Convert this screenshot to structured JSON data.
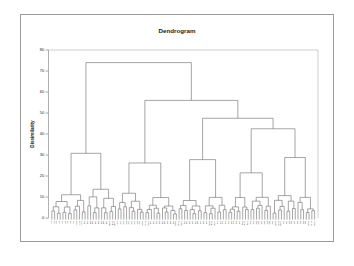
{
  "figure": {
    "title": "Dendrogram",
    "background_color": "#ffffff",
    "frame_color": "#9a9a9a",
    "line_color": "#6e6e6e"
  },
  "chart_data": {
    "type": "dendrogram",
    "title": "Dendrogram",
    "xlabel": "",
    "ylabel": "Dissimilarity",
    "ylim": [
      0,
      80
    ],
    "yticks": [
      0,
      10,
      20,
      30,
      40,
      50,
      60,
      70,
      80
    ],
    "ytick_labels": [
      "0",
      "10",
      "20",
      "30",
      "40",
      "50",
      "60",
      "70",
      "80"
    ],
    "grid": false,
    "legend": "none",
    "orientation": "top-down",
    "n_leaves": 96,
    "leaf_labels": [
      "A1",
      "A2",
      "A3",
      "A4",
      "A5",
      "A6",
      "A7",
      "A8",
      "A9",
      "A10",
      "A11",
      "A12",
      "B1",
      "B2",
      "B3",
      "B4",
      "B5",
      "B6",
      "B7",
      "B8",
      "B9",
      "B10",
      "B11",
      "B12",
      "C1",
      "C2",
      "C3",
      "C4",
      "C5",
      "C6",
      "C7",
      "C8",
      "C9",
      "C10",
      "C11",
      "C12",
      "D1",
      "D2",
      "D3",
      "D4",
      "D5",
      "D6",
      "D7",
      "D8",
      "D9",
      "D10",
      "D11",
      "D12",
      "E1",
      "E2",
      "E3",
      "E4",
      "E5",
      "E6",
      "E7",
      "E8",
      "E9",
      "E10",
      "E11",
      "E12",
      "F1",
      "F2",
      "F3",
      "F4",
      "F5",
      "F6",
      "F7",
      "F8",
      "F9",
      "F10",
      "F11",
      "F12",
      "G1",
      "G2",
      "G3",
      "G4",
      "G5",
      "G6",
      "G7",
      "G8",
      "G9",
      "G10",
      "G11",
      "G12",
      "H1",
      "H2",
      "H3",
      "H4",
      "H5",
      "H6",
      "H7",
      "H8",
      "H9",
      "H10",
      "H11",
      "H12"
    ],
    "root_height": 74,
    "merge_heights": [
      74.0,
      56.0,
      47.5,
      42.5,
      30.8,
      27.8,
      26.2,
      25.8,
      22.2,
      21.5,
      21.3,
      28.8,
      19.2,
      16.2,
      14.2,
      14.7,
      11.8,
      9.8,
      9.5,
      9.8,
      9.3,
      8.0,
      7.6,
      7.2,
      6.8,
      6.4,
      6.1,
      5.8,
      5.4,
      5.0
    ],
    "nodes": [
      {
        "id": "r",
        "height": 74.0,
        "children": [
          "L",
          "R"
        ]
      },
      {
        "id": "L",
        "height": 30.8,
        "children": [
          "L1",
          "L2"
        ]
      },
      {
        "id": "R",
        "height": 56.0,
        "children": [
          "RA",
          "RB"
        ]
      },
      {
        "id": "RB",
        "height": 47.5,
        "children": [
          "RB1",
          "RB2"
        ]
      },
      {
        "id": "RB2",
        "height": 42.5,
        "children": [
          "RB2a",
          "RB2b"
        ]
      }
    ]
  },
  "axes": {
    "y_axis_name": "Dissimilarity",
    "tick_count": 9
  }
}
